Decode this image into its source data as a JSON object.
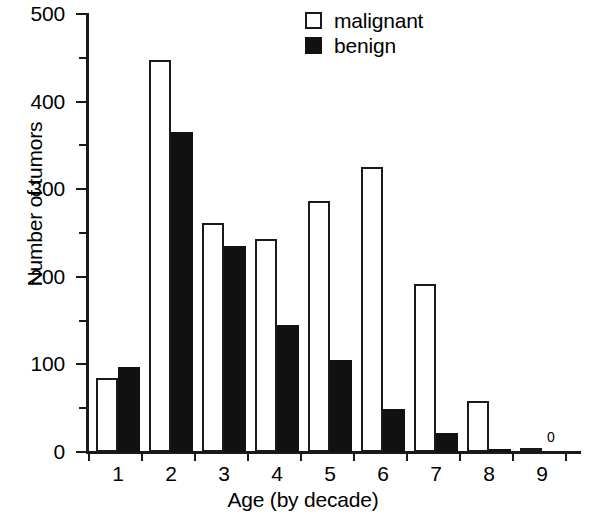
{
  "chart_data": {
    "type": "bar",
    "title": "",
    "xlabel": "Age (by decade)",
    "ylabel": "Number of tumors",
    "categories": [
      "1",
      "2",
      "3",
      "4",
      "5",
      "6",
      "7",
      "8",
      "9"
    ],
    "series": [
      {
        "name": "malignant",
        "style": "open",
        "color": "#ffffff",
        "edge_color": "#1a1a1a",
        "values": [
          85,
          447,
          262,
          243,
          287,
          325,
          192,
          58,
          5
        ]
      },
      {
        "name": "benign",
        "style": "filled",
        "color": "#111111",
        "edge_color": "#111111",
        "values": [
          97,
          365,
          235,
          145,
          105,
          49,
          22,
          4,
          0
        ]
      }
    ],
    "ylim": [
      0,
      500
    ],
    "y_major_ticks": [
      0,
      100,
      200,
      300,
      400,
      500
    ],
    "y_minor_ticks": [
      50,
      150,
      250,
      350,
      450
    ],
    "y_tick_labels": [
      "0",
      "100",
      "200",
      "300",
      "400",
      "500"
    ],
    "grid": false,
    "legend_position": "top-center",
    "annotations": [
      {
        "text": "0",
        "category": "9",
        "series": "benign"
      }
    ]
  },
  "legend": {
    "items": [
      {
        "label": "malignant",
        "swatch": "open-square-icon"
      },
      {
        "label": "benign",
        "swatch": "filled-square-icon"
      }
    ]
  }
}
